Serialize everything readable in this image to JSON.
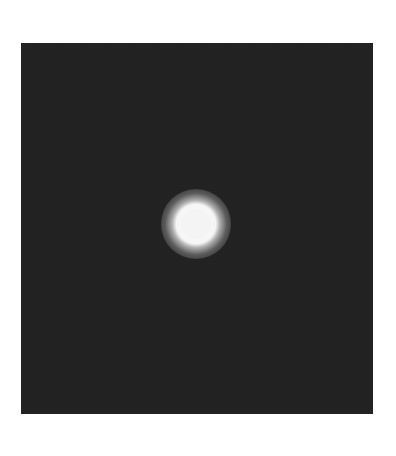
{
  "image": {
    "description": "Dark square field with a single bright glowing disc near the center",
    "colors": {
      "page_background": "#ffffff",
      "field": "#222222",
      "disc_core": "#f4f4f4"
    },
    "field": {
      "left": 21,
      "top": 43,
      "width": 352,
      "height": 371
    },
    "bright_spot": {
      "center_x": 175,
      "center_y": 181,
      "core_radius": 15,
      "glow_radius": 35
    }
  }
}
